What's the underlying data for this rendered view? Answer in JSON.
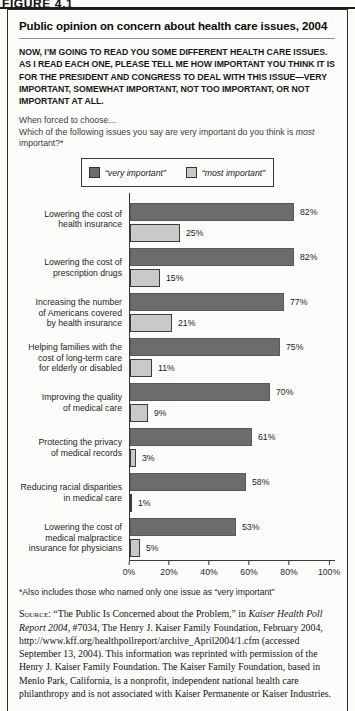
{
  "figure_label": "FIGURE 4.1",
  "panel": {
    "title": "Public opinion on concern about health care issues, 2004",
    "question_paragraph": "NOW, I’M GOING TO READ YOU SOME DIFFERENT HEALTH CARE ISSUES. AS I READ EACH ONE, PLEASE TELL ME HOW IMPORTANT YOU THINK IT IS FOR THE PRESIDENT AND CONGRESS TO DEAL WITH THIS ISSUE—VERY IMPORTANT, SOMEWHAT IMPORTANT, NOT TOO IMPORTANT, OR NOT IMPORTANT AT ALL.",
    "lead_in": "When forced to choose...",
    "sub_question_prefix": "Which of the following issues you say are very important do you think is ",
    "sub_question_italic": "most",
    "sub_question_suffix": " important?*"
  },
  "legend": [
    {
      "key": "very-important",
      "label": "“very important”",
      "color": "#6c6c6c"
    },
    {
      "key": "most-important",
      "label": "“most important”",
      "color": "#c9c9c9"
    }
  ],
  "chart_data": {
    "type": "bar",
    "orientation": "horizontal",
    "title": "Public opinion on concern about health care issues, 2004",
    "categories": [
      "Lowering the cost of\nhealth insurance",
      "Lowering the cost of\nprescription drugs",
      "Increasing the number\nof Americans covered\nby health insurance",
      "Helping families with the\ncost of long-term care\nfor elderly or disabled",
      "Improving the quality\nof medical care",
      "Protecting the privacy\nof medical records",
      "Reducing racial disparities\nin medical care",
      "Lowering the cost of\nmedical malpractice\ninsurance for physicians"
    ],
    "series": [
      {
        "name": "“very important”",
        "color": "#6c6c6c",
        "values": [
          82,
          82,
          77,
          75,
          70,
          61,
          58,
          53
        ]
      },
      {
        "name": "“most important”",
        "color": "#c9c9c9",
        "values": [
          25,
          15,
          21,
          11,
          9,
          3,
          1,
          5
        ]
      }
    ],
    "value_suffix": "%",
    "xlim": [
      0,
      100
    ],
    "x_ticks": [
      {
        "label": "0%",
        "value": 0
      },
      {
        "label": "20%",
        "value": 20
      },
      {
        "label": "40%",
        "value": 40
      },
      {
        "label": "60%",
        "value": 60
      },
      {
        "label": "80%",
        "value": 80
      },
      {
        "label": "100%",
        "value": 100
      }
    ],
    "grid": false,
    "legend_position": "top-center"
  },
  "footnote": "*Also includes those who named only one issue as “very important”",
  "source": {
    "segments": [
      {
        "style": "smallcaps",
        "text": "Source:"
      },
      {
        "style": "normal",
        "text": " “The Public Is Concerned about the Problem,” in "
      },
      {
        "style": "italic",
        "text": "Kaiser Health Poll Report 2004"
      },
      {
        "style": "normal",
        "text": ", #7034, The Henry J. Kaiser Family Foundation, February 2004, http://www.kff.org/healthpollreport/archive_April2004/1.cfm (accessed September 13, 2004). This information was reprinted with permission of the Henry J. Kaiser Family Foundation. The Kaiser Family Foundation, based in Menlo Park, California, is a nonprofit, independent national health care philanthropy and is not associated with Kaiser Permanente or Kaiser Industries."
      }
    ]
  }
}
